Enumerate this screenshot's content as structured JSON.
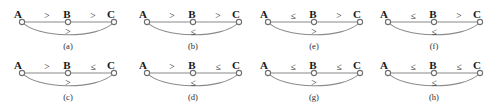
{
  "figure": {
    "width": 497,
    "height": 102,
    "columns": 4,
    "rows": 2,
    "line_color": "#8a8a8a",
    "node_color": "#ffffff",
    "node_stroke": "#6f6f6f",
    "text_color": "#1a1a1a",
    "background": "#ffffff"
  },
  "vertices": {
    "a": "A",
    "b": "B",
    "c": "C"
  },
  "operators": {
    "gt": ">",
    "le": "≤"
  },
  "panels": [
    {
      "id": "panel-a",
      "caption": "(a)",
      "left": 8,
      "top": 0,
      "labels": {
        "a": "A",
        "b": "B",
        "c": "C"
      },
      "edges": {
        "ab": ">",
        "bc": ">",
        "ac": ">"
      }
    },
    {
      "id": "panel-b",
      "caption": "(b)",
      "left": 133,
      "top": 0,
      "labels": {
        "a": "A",
        "b": "B",
        "c": "C"
      },
      "edges": {
        "ab": ">",
        "bc": ">",
        "ac": "≤"
      }
    },
    {
      "id": "panel-e",
      "caption": "(e)",
      "left": 254,
      "top": 0,
      "labels": {
        "a": "A",
        "b": "B",
        "c": "C"
      },
      "edges": {
        "ab": "≤",
        "bc": ">",
        "ac": ">"
      }
    },
    {
      "id": "panel-f",
      "caption": "(f)",
      "left": 374,
      "top": 0,
      "labels": {
        "a": "A",
        "b": "B",
        "c": "C"
      },
      "edges": {
        "ab": "≤",
        "bc": ">",
        "ac": "≤"
      }
    },
    {
      "id": "panel-c",
      "caption": "(c)",
      "left": 8,
      "top": 51,
      "labels": {
        "a": "A",
        "b": "B",
        "c": "C"
      },
      "edges": {
        "ab": ">",
        "bc": "≤",
        "ac": ">"
      }
    },
    {
      "id": "panel-d",
      "caption": "(d)",
      "left": 133,
      "top": 51,
      "labels": {
        "a": "A",
        "b": "B",
        "c": "C"
      },
      "edges": {
        "ab": ">",
        "bc": "≤",
        "ac": "≤"
      }
    },
    {
      "id": "panel-g",
      "caption": "(g)",
      "left": 254,
      "top": 51,
      "labels": {
        "a": "A",
        "b": "B",
        "c": "C"
      },
      "edges": {
        "ab": "≤",
        "bc": "≤",
        "ac": ">"
      }
    },
    {
      "id": "panel-h",
      "caption": "(h)",
      "left": 374,
      "top": 51,
      "labels": {
        "a": "A",
        "b": "B",
        "c": "C"
      },
      "edges": {
        "ab": "≤",
        "bc": "≤",
        "ac": "≤"
      }
    }
  ]
}
